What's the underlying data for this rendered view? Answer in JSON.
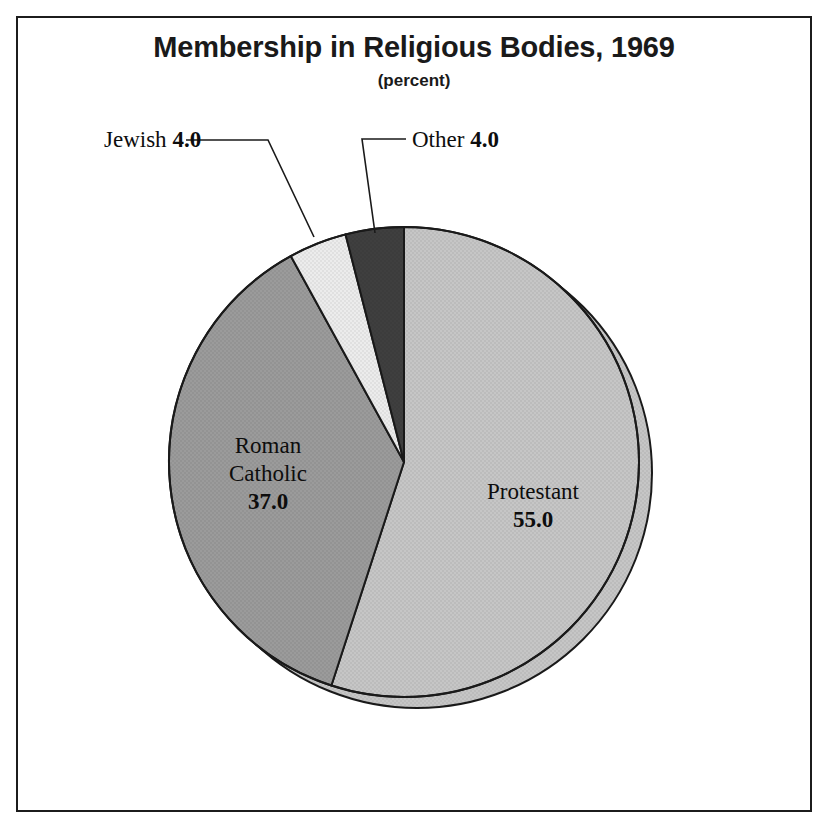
{
  "chart_data": {
    "type": "pie",
    "title": "Membership in Religious Bodies, 1969",
    "subtitle": "(percent)",
    "units": "percent",
    "start_angle_deg": 0,
    "direction": "clockwise",
    "categories": [
      "Protestant",
      "Roman Catholic",
      "Jewish",
      "Other"
    ],
    "values": [
      55.0,
      37.0,
      4.0,
      4.0
    ],
    "slices": [
      {
        "label": "Protestant",
        "value_text": "55.0",
        "value": 55.0,
        "color": "#c6c6c6",
        "start_deg": 0,
        "end_deg": 198,
        "label_placement": "inside"
      },
      {
        "label": "Roman Catholic",
        "label_line1": "Roman",
        "label_line2": "Catholic",
        "value_text": "37.0",
        "value": 37.0,
        "color": "#9b9b9b",
        "start_deg": 198,
        "end_deg": 331.2,
        "label_placement": "inside"
      },
      {
        "label": "Jewish",
        "value_text": "4.0",
        "value": 4.0,
        "color": "#ececec",
        "start_deg": 331.2,
        "end_deg": 345.6,
        "label_placement": "callout"
      },
      {
        "label": "Other",
        "value_text": "4.0",
        "value": 4.0,
        "color": "#3f3f3f",
        "start_deg": 345.6,
        "end_deg": 360,
        "label_placement": "callout"
      }
    ],
    "legend": "none",
    "grid": false
  },
  "figure": {
    "frame_color": "#1c1c1c",
    "background": "#ffffff",
    "outline_color": "#1a1a1a",
    "shadow_ring_color": "#c6c6c6"
  },
  "geometry": {
    "center_x": 404,
    "center_y": 462,
    "radius": 235,
    "shadow_offset_x": 13,
    "shadow_offset_y": 11
  },
  "callouts": {
    "jewish": {
      "name": "Jewish",
      "value_text": "4.0",
      "line": "M 186 140 L 268 140 L 314 237"
    },
    "other": {
      "name": "Other",
      "value_text": "4.0",
      "line": "M 406 139 L 362 139 L 375 233"
    }
  }
}
